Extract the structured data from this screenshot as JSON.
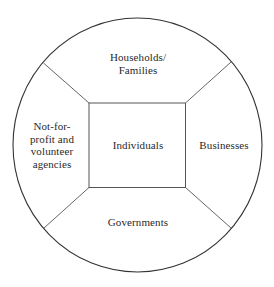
{
  "diagram": {
    "type": "concentric-sectors",
    "center": {
      "label": "Individuals"
    },
    "sectors": {
      "top": {
        "lines": [
          "Households/",
          "Families"
        ]
      },
      "right": {
        "lines": [
          "Businesses"
        ]
      },
      "bottom": {
        "lines": [
          "Governments"
        ]
      },
      "left": {
        "lines": [
          "Not-for-",
          "profit and",
          "volunteer",
          "agencies"
        ]
      }
    },
    "colors": {
      "background": "#ffffff",
      "circle_stroke": "#333333",
      "line_stroke": "#555555",
      "text": "#2a2a2a"
    }
  }
}
